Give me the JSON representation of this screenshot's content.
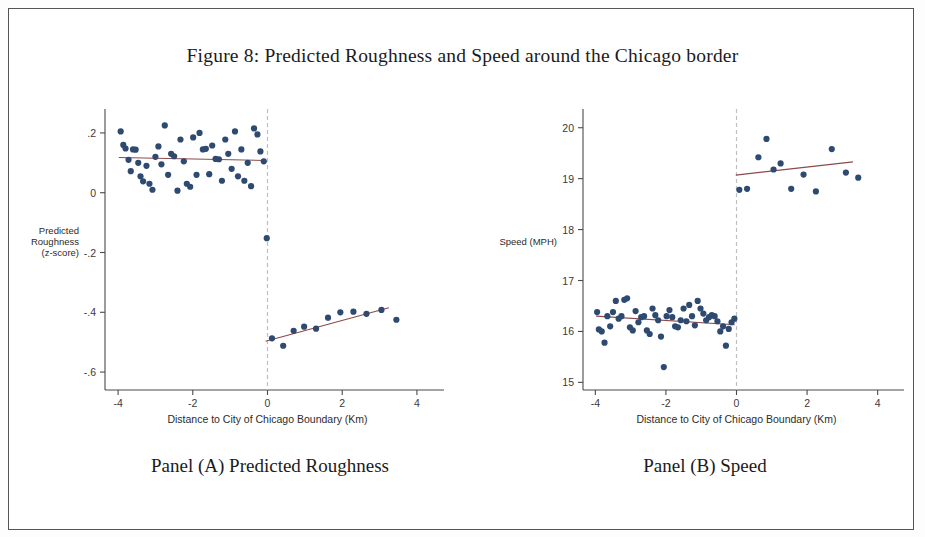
{
  "figure": {
    "title": "Figure 8: Predicted Roughness and Speed around the Chicago border",
    "caption_a": "Panel (A) Predicted Roughness",
    "caption_b": "Panel (B) Speed"
  },
  "colors": {
    "point": "#2e4a70",
    "fit_line": "#8c4a4a",
    "axis": "#4a4a4a",
    "cutoff_line": "#bfbfbf",
    "page_border": "#555555",
    "background": "#ffffff"
  },
  "chart_data": [
    {
      "type": "scatter",
      "title": "Panel (A) Predicted Roughness",
      "xlabel": "Distance to City of Chicago Boundary (Km)",
      "ylabel": "Predicted Roughness (z-score)",
      "ylabel_lines": [
        "Predicted",
        "Roughness",
        "(z-score)"
      ],
      "xlim": [
        -4.35,
        4.35
      ],
      "ylim": [
        -0.66,
        0.26
      ],
      "xticks": [
        -4,
        -2,
        0,
        2,
        4
      ],
      "xticklabels": [
        "-4",
        "-2",
        "0",
        "2",
        "4"
      ],
      "yticks": [
        0.2,
        0,
        -0.2,
        -0.4,
        -0.6
      ],
      "yticklabels": [
        ".2",
        "0",
        "-.2",
        "-.4",
        "-.6"
      ],
      "grid": false,
      "legend": null,
      "cutoff_x": 0,
      "cutoff_style": "dashed",
      "series": [
        {
          "name": "Binned means (left of cutoff)",
          "marker": "filled-circle",
          "x": [
            -3.93,
            -3.86,
            -3.8,
            -3.72,
            -3.66,
            -3.6,
            -3.53,
            -3.46,
            -3.4,
            -3.33,
            -3.24,
            -3.16,
            -3.08,
            -3.0,
            -2.92,
            -2.84,
            -2.75,
            -2.66,
            -2.58,
            -2.5,
            -2.41,
            -2.33,
            -2.24,
            -2.16,
            -2.07,
            -1.99,
            -1.9,
            -1.82,
            -1.73,
            -1.65,
            -1.56,
            -1.48,
            -1.39,
            -1.3,
            -1.22,
            -1.13,
            -1.05,
            -0.96,
            -0.87,
            -0.79,
            -0.7,
            -0.62,
            -0.53,
            -0.44,
            -0.36,
            -0.27,
            -0.19,
            -0.1
          ],
          "y": [
            0.205,
            0.16,
            0.148,
            0.11,
            0.072,
            0.145,
            0.144,
            0.1,
            0.055,
            0.038,
            0.09,
            0.03,
            0.01,
            0.12,
            0.155,
            0.095,
            0.225,
            0.06,
            0.13,
            0.122,
            0.007,
            0.178,
            0.105,
            0.03,
            0.02,
            0.185,
            0.06,
            0.2,
            0.145,
            0.147,
            0.062,
            0.158,
            0.113,
            0.112,
            0.04,
            0.178,
            0.13,
            0.08,
            0.205,
            0.055,
            0.145,
            0.04,
            0.1,
            0.022,
            0.215,
            0.195,
            0.138,
            0.105
          ]
        },
        {
          "name": "Binned means (right of cutoff)",
          "marker": "filled-circle",
          "x": [
            -0.02,
            0.12,
            0.42,
            0.7,
            0.98,
            1.3,
            1.62,
            1.95,
            2.3,
            2.65,
            3.05,
            3.45
          ],
          "y": [
            -0.152,
            -0.487,
            -0.512,
            -0.462,
            -0.448,
            -0.455,
            -0.418,
            -0.4,
            -0.398,
            -0.405,
            -0.392,
            -0.425
          ]
        }
      ],
      "fit_lines": [
        {
          "name": "Left fit",
          "x": [
            -3.98,
            -0.05
          ],
          "y": [
            0.118,
            0.108
          ]
        },
        {
          "name": "Right fit",
          "x": [
            -0.05,
            3.25
          ],
          "y": [
            -0.497,
            -0.385
          ]
        }
      ]
    },
    {
      "type": "scatter",
      "title": "Panel (B) Speed",
      "xlabel": "Distance to City of Chicago Boundary (Km)",
      "ylabel": "Speed (MPH)",
      "ylabel_lines": [
        "Speed (MPH)"
      ],
      "xlim": [
        -4.35,
        4.35
      ],
      "ylim": [
        14.85,
        20.25
      ],
      "xticks": [
        -4,
        -2,
        0,
        2,
        4
      ],
      "xticklabels": [
        "-4",
        "-2",
        "0",
        "2",
        "4"
      ],
      "yticks": [
        20,
        19,
        18,
        17,
        16,
        15
      ],
      "yticklabels": [
        "20",
        "19",
        "18",
        "17",
        "16",
        "15"
      ],
      "grid": false,
      "legend": null,
      "cutoff_x": 0,
      "cutoff_style": "dashed",
      "series": [
        {
          "name": "Binned means (left of cutoff)",
          "marker": "filled-circle",
          "x": [
            -3.95,
            -3.9,
            -3.82,
            -3.74,
            -3.66,
            -3.58,
            -3.5,
            -3.42,
            -3.34,
            -3.26,
            -3.18,
            -3.1,
            -3.02,
            -2.94,
            -2.86,
            -2.78,
            -2.7,
            -2.62,
            -2.54,
            -2.46,
            -2.38,
            -2.3,
            -2.22,
            -2.14,
            -2.06,
            -1.98,
            -1.9,
            -1.82,
            -1.74,
            -1.66,
            -1.58,
            -1.5,
            -1.42,
            -1.34,
            -1.26,
            -1.18,
            -1.1,
            -1.02,
            -0.94,
            -0.86,
            -0.78,
            -0.7,
            -0.62,
            -0.54,
            -0.46,
            -0.38,
            -0.3,
            -0.22,
            -0.14,
            -0.06
          ],
          "y": [
            16.38,
            16.04,
            16.0,
            15.78,
            16.3,
            16.1,
            16.38,
            16.6,
            16.25,
            16.3,
            16.62,
            16.65,
            16.08,
            16.02,
            16.4,
            16.18,
            16.28,
            16.3,
            16.02,
            15.95,
            16.45,
            16.32,
            16.22,
            15.9,
            15.3,
            16.3,
            16.42,
            16.28,
            16.1,
            16.08,
            16.22,
            16.45,
            16.2,
            16.52,
            16.3,
            16.12,
            16.6,
            16.45,
            16.35,
            16.22,
            16.28,
            16.32,
            16.3,
            16.2,
            16.0,
            16.1,
            15.72,
            16.05,
            16.18,
            16.25
          ]
        },
        {
          "name": "Binned means (right of cutoff)",
          "marker": "filled-circle",
          "x": [
            0.08,
            0.3,
            0.62,
            0.85,
            1.05,
            1.25,
            1.55,
            1.9,
            2.25,
            2.7,
            3.1,
            3.45
          ],
          "y": [
            18.78,
            18.8,
            19.42,
            19.78,
            19.18,
            19.3,
            18.8,
            19.08,
            18.75,
            19.58,
            19.12,
            19.02
          ]
        }
      ],
      "fit_lines": [
        {
          "name": "Left fit",
          "x": [
            -3.98,
            -0.05
          ],
          "y": [
            16.3,
            16.13
          ]
        },
        {
          "name": "Right fit",
          "x": [
            -0.02,
            3.3
          ],
          "y": [
            19.07,
            19.33
          ]
        }
      ]
    }
  ]
}
